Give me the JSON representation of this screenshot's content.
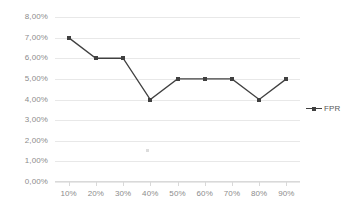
{
  "chart_data": {
    "type": "line",
    "title": "",
    "subtitle": "",
    "xlabel": "",
    "ylabel": "",
    "categories": [
      "10%",
      "20%",
      "30%",
      "40%",
      "50%",
      "60%",
      "70%",
      "80%",
      "90%"
    ],
    "series": [
      {
        "name": "FPR",
        "values": [
          7.0,
          6.0,
          6.0,
          4.0,
          5.0,
          5.0,
          5.0,
          4.0,
          5.0
        ],
        "color": "#404040",
        "marker": "square"
      }
    ],
    "ylim": [
      0,
      8
    ],
    "ytick_values": [
      8,
      7,
      6,
      5,
      4,
      3,
      2,
      1,
      0
    ],
    "ytick_labels": [
      "8,00%",
      "7,00%",
      "6,00%",
      "5,00%",
      "4,00%",
      "3,00%",
      "2,00%",
      "1,00%",
      "0,00%"
    ],
    "xtick_labels": [
      "10%",
      "20%",
      "30%",
      "40%",
      "50%",
      "60%",
      "70%",
      "80%",
      "90%"
    ],
    "grid": true,
    "grid_axis": "y",
    "legend_position": "right",
    "legend_entries": [
      "FPR"
    ],
    "background_color": "#ffffff",
    "gridline_color": "#e8e8e8",
    "tick_label_color": "#8c8c8c",
    "annotations": []
  },
  "legend": {
    "fpr_label": "FPR"
  }
}
